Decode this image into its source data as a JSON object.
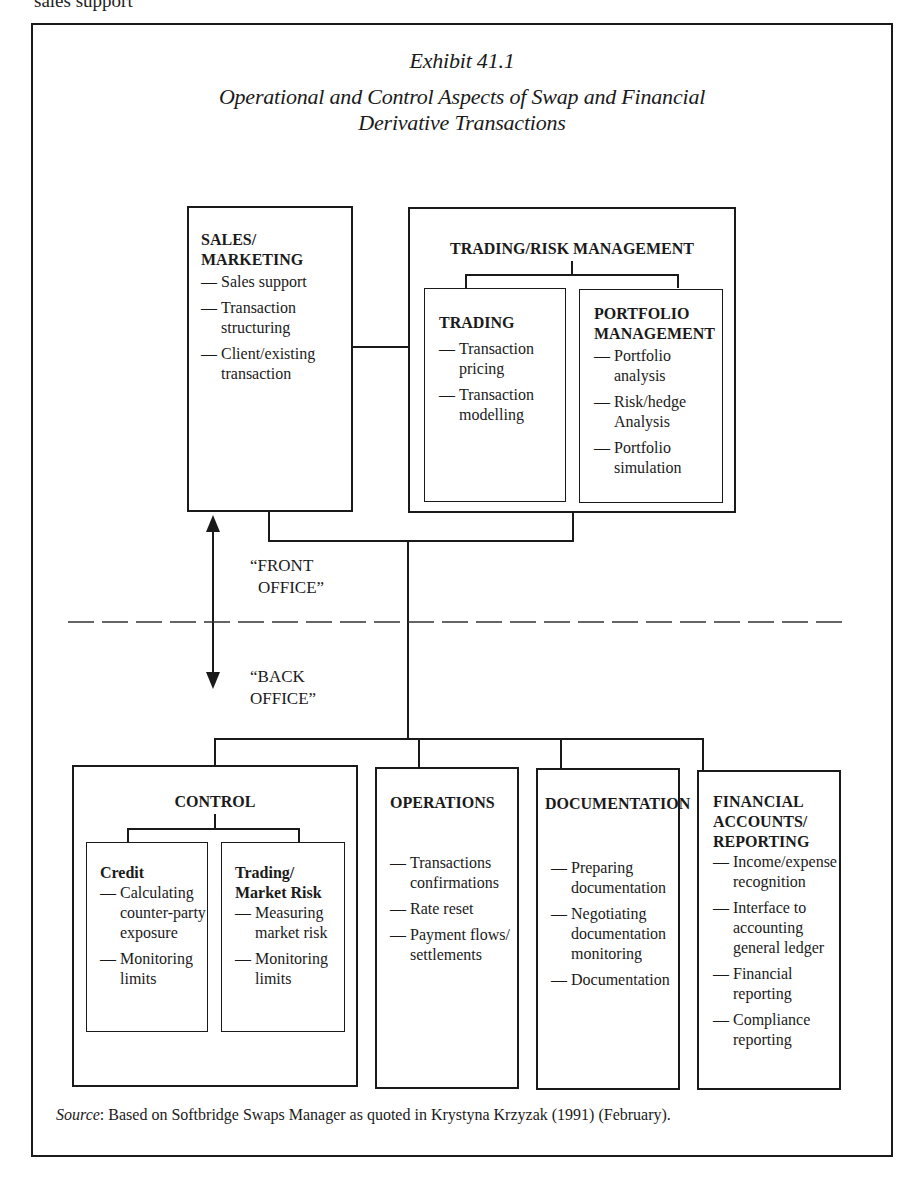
{
  "page_cutoff_text": "sales support",
  "exhibit": {
    "number": "Exhibit 41.1",
    "title_line1": "Operational and Control Aspects of Swap and Financial",
    "title_line2": "Derivative Transactions"
  },
  "front_office": {
    "sales": {
      "heading_line1": "SALES/",
      "heading_line2": "MARKETING",
      "items": [
        "Sales support",
        "Transaction structuring",
        "Client/existing transaction"
      ]
    },
    "trading_risk": {
      "heading": "TRADING/RISK MANAGEMENT",
      "trading": {
        "heading": "TRADING",
        "items": [
          "Transaction pricing",
          "Transaction modelling"
        ]
      },
      "portfolio": {
        "heading_line1": "PORTFOLIO",
        "heading_line2": "MANAGEMENT",
        "items": [
          "Portfolio analysis",
          "Risk/hedge Analysis",
          "Portfolio simulation"
        ]
      }
    }
  },
  "divider": {
    "front_label_line1": "“FRONT",
    "front_label_line2": "OFFICE”",
    "back_label_line1": "“BACK",
    "back_label_line2": "OFFICE”"
  },
  "back_office": {
    "control": {
      "heading": "CONTROL",
      "credit": {
        "heading": "Credit",
        "items": [
          "Calculating counter-party exposure",
          "Monitoring limits"
        ]
      },
      "market_risk": {
        "heading_line1": "Trading/",
        "heading_line2": "Market Risk",
        "items": [
          "Measuring market risk",
          "Monitoring limits"
        ]
      }
    },
    "operations": {
      "heading": "OPERATIONS",
      "items": [
        "Transactions confirmations",
        "Rate reset",
        "Payment flows/ settlements"
      ]
    },
    "documentation": {
      "heading": "DOCUMENTATION",
      "items": [
        "Preparing documentation",
        "Negotiating documentation monitoring",
        "Documentation"
      ]
    },
    "financial": {
      "heading_line1": "FINANCIAL",
      "heading_line2": "ACCOUNTS/",
      "heading_line3": "REPORTING",
      "items": [
        "Income/expense recognition",
        "Interface to accounting general ledger",
        "Financial reporting",
        "Compliance reporting"
      ]
    }
  },
  "source": {
    "label": "Source",
    "text": ": Based on Softbridge Swaps Manager as quoted in Krystyna Krzyzak (1991) (February)."
  },
  "glyphs": {
    "dash": "—"
  }
}
